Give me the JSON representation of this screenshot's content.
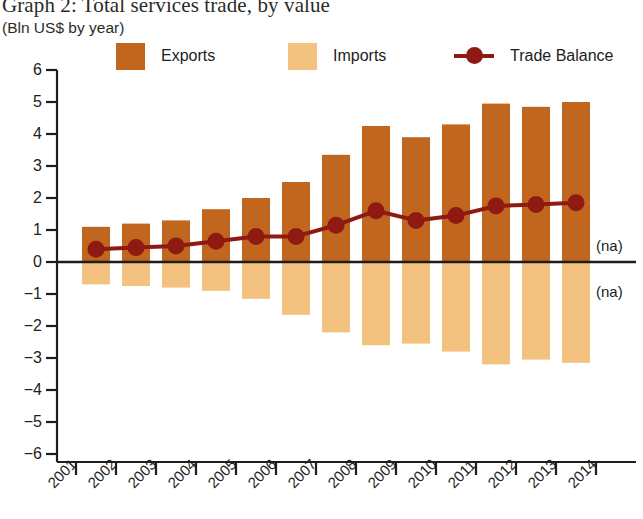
{
  "title": "Graph 2: Total services trade, by value",
  "subtitle": "(Bln US$ by year)",
  "legend": {
    "exports": "Exports",
    "imports": "Imports",
    "balance": "Trade Balance"
  },
  "colors": {
    "exports": "#C0661F",
    "imports": "#F2C27E",
    "balance": "#8E1A12",
    "axis": "#1d1d1b",
    "text": "#1d1d1b"
  },
  "annotations": {
    "na_above": "(na)",
    "na_below": "(na)"
  },
  "chart_data": {
    "type": "bar",
    "title": "Graph 2: Total services trade, by value",
    "subtitle": "(Bln US$ by year)",
    "xlabel": "",
    "ylabel": "Bln US$",
    "ylim": [
      -6,
      6
    ],
    "ytick_labels": [
      "6",
      "5",
      "4",
      "3",
      "2",
      "1",
      "0",
      "−1",
      "−2",
      "−3",
      "−4",
      "−5",
      "−6"
    ],
    "ytick_values": [
      6,
      5,
      4,
      3,
      2,
      1,
      0,
      -1,
      -2,
      -3,
      -4,
      -5,
      -6
    ],
    "grid": false,
    "legend_position": "top",
    "categories": [
      "2001",
      "2002",
      "2003",
      "2004",
      "2005",
      "2006",
      "2007",
      "2008",
      "2009",
      "2010",
      "2011",
      "2012",
      "2013"
    ],
    "xtick_labels": [
      "2001",
      "2002",
      "2003",
      "2004",
      "2005",
      "2006",
      "2007",
      "2008",
      "2009",
      "2010",
      "2011",
      "2012",
      "2013",
      "2014"
    ],
    "series": [
      {
        "name": "Exports",
        "type": "bar",
        "color": "#C0661F",
        "values": [
          1.1,
          1.2,
          1.3,
          1.65,
          2.0,
          2.5,
          3.35,
          4.25,
          3.9,
          4.3,
          4.95,
          4.85,
          5.0
        ]
      },
      {
        "name": "Imports",
        "type": "bar",
        "color": "#F2C27E",
        "values": [
          -0.7,
          -0.75,
          -0.8,
          -0.9,
          -1.15,
          -1.65,
          -2.2,
          -2.6,
          -2.55,
          -2.8,
          -3.2,
          -3.05,
          -3.15
        ]
      },
      {
        "name": "Trade Balance",
        "type": "line",
        "color": "#8E1A12",
        "values": [
          0.4,
          0.45,
          0.5,
          0.65,
          0.8,
          0.8,
          1.15,
          1.6,
          1.3,
          1.45,
          1.75,
          1.8,
          1.85
        ]
      }
    ]
  }
}
